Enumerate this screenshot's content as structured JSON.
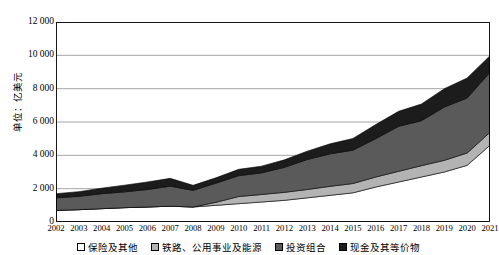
{
  "chart_data": {
    "type": "area",
    "title": "",
    "subtitle": "",
    "stacked": true,
    "xlabel": "",
    "ylabel": "单位：亿美元",
    "ylim": [
      0,
      12000
    ],
    "ytick_step": 2000,
    "grid": true,
    "legend_position": "bottom",
    "categories": [
      "2002",
      "2003",
      "2004",
      "2005",
      "2006",
      "2007",
      "2008",
      "2009",
      "2010",
      "2011",
      "2012",
      "2013",
      "2014",
      "2015",
      "2016",
      "2017",
      "2018",
      "2019",
      "2020",
      "2021"
    ],
    "series": [
      {
        "name": "保险及其他",
        "color": "#ffffff",
        "values": [
          700,
          740,
          800,
          860,
          900,
          950,
          900,
          1000,
          1100,
          1200,
          1300,
          1450,
          1600,
          1750,
          2100,
          2400,
          2700,
          3000,
          3400,
          4600
        ]
      },
      {
        "name": "铁路、公用事业及能源",
        "color": "#b3b3b3",
        "values": [
          0,
          0,
          0,
          0,
          0,
          0,
          0,
          180,
          430,
          450,
          480,
          500,
          540,
          560,
          600,
          640,
          680,
          700,
          740,
          780
        ]
      },
      {
        "name": "投资组合",
        "color": "#5a5a5a",
        "values": [
          750,
          800,
          900,
          950,
          1050,
          1200,
          1000,
          1150,
          1250,
          1300,
          1500,
          1800,
          1950,
          2000,
          2300,
          2700,
          2700,
          3200,
          3300,
          3600
        ]
      },
      {
        "name": "现金及其等价物",
        "color": "#1c1c1c",
        "values": [
          250,
          280,
          330,
          400,
          450,
          470,
          300,
          320,
          380,
          400,
          450,
          500,
          600,
          700,
          850,
          900,
          1000,
          1100,
          1200,
          1000
        ]
      }
    ],
    "ytick_labels": [
      "0",
      "2 000",
      "4 000",
      "6 000",
      "8 000",
      "10 000",
      "12 000"
    ],
    "ytick_values": [
      0,
      2000,
      4000,
      6000,
      8000,
      10000,
      12000
    ]
  },
  "legend": {
    "items": [
      {
        "label": "保险及其他",
        "color": "#ffffff"
      },
      {
        "label": "铁路、公用事业及能源",
        "color": "#b3b3b3"
      },
      {
        "label": "投资组合",
        "color": "#5a5a5a"
      },
      {
        "label": "现金及其等价物",
        "color": "#1c1c1c"
      }
    ]
  }
}
